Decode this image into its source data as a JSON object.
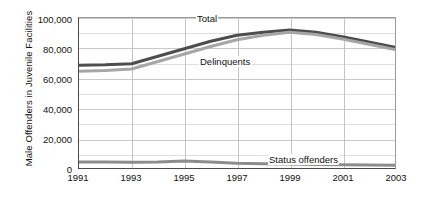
{
  "chart_data": {
    "type": "line",
    "title": "",
    "xlabel": "",
    "ylabel": "Male Offenders in Juvenile Facilities",
    "x": [
      1991,
      1992,
      1993,
      1994,
      1995,
      1996,
      1997,
      1998,
      1999,
      2000,
      2001,
      2002,
      2003
    ],
    "xlim": [
      1991,
      2003
    ],
    "ylim": [
      0,
      100000
    ],
    "ytick_labels": [
      "0",
      "20,000",
      "40,000",
      "60,000",
      "80,000",
      "100,000"
    ],
    "ytick_values": [
      0,
      20000,
      40000,
      60000,
      80000,
      100000
    ],
    "xtick_labels": [
      "1991",
      "1993",
      "1995",
      "1997",
      "1999",
      "2001",
      "2003"
    ],
    "xtick_values": [
      1991,
      1993,
      1995,
      1997,
      1999,
      2001,
      2003
    ],
    "grid": true,
    "minor_grid": true,
    "legend_position": "inline-annotations",
    "series": [
      {
        "name": "Total",
        "color": "#4d4d4d",
        "values": [
          68500,
          68800,
          69500,
          74500,
          79500,
          84500,
          88500,
          90500,
          92000,
          90500,
          87500,
          84000,
          80500
        ]
      },
      {
        "name": "Delinquents",
        "color": "#a6a6a6",
        "values": [
          64500,
          65000,
          66000,
          71000,
          76000,
          81000,
          85500,
          88500,
          90500,
          89000,
          86000,
          82500,
          79000
        ]
      },
      {
        "name": "Status offenders",
        "color": "#8c8c8c",
        "values": [
          4000,
          4000,
          3800,
          4000,
          4600,
          4000,
          3200,
          2800,
          2600,
          2400,
          2200,
          2000,
          1900
        ]
      }
    ],
    "annotations": [
      {
        "text": "Total",
        "x": 1996,
        "y": 97000
      },
      {
        "text": "Delinquents",
        "x": 1996,
        "y": 68000
      },
      {
        "text": "Status offenders",
        "x": 2000,
        "y": 9000
      }
    ]
  }
}
